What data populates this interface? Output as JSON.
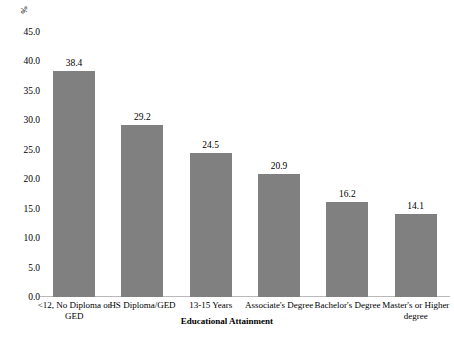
{
  "chart_data": {
    "type": "bar",
    "title": "",
    "xlabel": "Educational Attainment",
    "ylabel": "%",
    "categories": [
      "<12, No Diploma or GED",
      "HS Diploma/GED",
      "13-15 Years",
      "Associate's Degree",
      "Bachelor's Degree",
      "Master's or Higher degree"
    ],
    "values": [
      38.4,
      29.2,
      24.5,
      20.9,
      16.2,
      14.1
    ],
    "value_labels": [
      "38.4",
      "29.2",
      "24.5",
      "20.9",
      "16.2",
      "14.1"
    ],
    "ylim": [
      0.0,
      45.0
    ],
    "ytick_values": [
      0.0,
      5.0,
      10.0,
      15.0,
      20.0,
      25.0,
      30.0,
      35.0,
      40.0,
      45.0
    ],
    "ytick_labels": [
      "0.0",
      "5.0",
      "10.0",
      "15.0",
      "20.0",
      "25.0",
      "30.0",
      "35.0",
      "40.0",
      "45.0"
    ],
    "grid": false,
    "legend": false,
    "bar_color": "#808080",
    "background_color": "#ffffff",
    "axis_color": "#b9b9b9"
  }
}
